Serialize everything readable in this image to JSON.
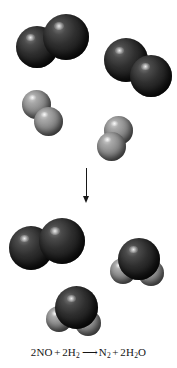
{
  "figure": {
    "background_color": "#ffffff",
    "width": 177,
    "height": 368
  },
  "colors": {
    "dark_atom": "#1d1d1d",
    "light_atom": "#8d8d8d",
    "arrow": "#171717",
    "text": "#151515"
  },
  "reactants": {
    "label": "reactants",
    "molecules": [
      {
        "name": "nitrogen-monoxide-1",
        "formula": "NO",
        "atoms": [
          {
            "element": "N",
            "shade": "dark"
          },
          {
            "element": "O",
            "shade": "dark"
          }
        ]
      },
      {
        "name": "nitrogen-monoxide-2",
        "formula": "NO",
        "atoms": [
          {
            "element": "N",
            "shade": "dark"
          },
          {
            "element": "O",
            "shade": "dark"
          }
        ]
      },
      {
        "name": "hydrogen-1",
        "formula": "H2",
        "atoms": [
          {
            "element": "H",
            "shade": "light"
          },
          {
            "element": "H",
            "shade": "light"
          }
        ]
      },
      {
        "name": "hydrogen-2",
        "formula": "H2",
        "atoms": [
          {
            "element": "H",
            "shade": "light"
          },
          {
            "element": "H",
            "shade": "light"
          }
        ]
      }
    ]
  },
  "arrow": {
    "name": "reaction-arrow",
    "direction": "down",
    "glyph": "↓"
  },
  "products": {
    "label": "products",
    "molecules": [
      {
        "name": "dinitrogen",
        "formula": "N2",
        "atoms": [
          {
            "element": "N",
            "shade": "dark"
          },
          {
            "element": "N",
            "shade": "dark"
          }
        ]
      },
      {
        "name": "water-1",
        "formula": "H2O",
        "atoms": [
          {
            "element": "O",
            "shade": "dark"
          },
          {
            "element": "H",
            "shade": "light"
          },
          {
            "element": "H",
            "shade": "light"
          }
        ]
      },
      {
        "name": "water-2",
        "formula": "H2O",
        "atoms": [
          {
            "element": "O",
            "shade": "dark"
          },
          {
            "element": "H",
            "shade": "light"
          },
          {
            "element": "H",
            "shade": "light"
          }
        ]
      }
    ]
  },
  "equation": {
    "full_text": "2NO + 2H2 ⟶ N2 + 2H2O",
    "left": {
      "term1_coefficient": "2",
      "term1_formula": "NO",
      "plus": "+",
      "term2_coefficient": "2",
      "term2_formula": "H",
      "term2_subscript": "2"
    },
    "arrow_glyph": "⟶",
    "right": {
      "term1_formula": "N",
      "term1_subscript": "2",
      "plus": "+",
      "term2_coefficient": "2",
      "term2_formula_a": "H",
      "term2_subscript": "2",
      "term2_formula_b": "O"
    }
  }
}
